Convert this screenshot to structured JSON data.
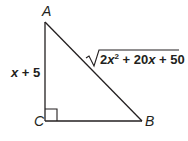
{
  "diagram": {
    "type": "right-triangle",
    "colors": {
      "stroke": "#231f20",
      "text": "#231f20",
      "background": "#ffffff"
    },
    "vertices": {
      "A": {
        "label": "A"
      },
      "B": {
        "label": "B"
      },
      "C": {
        "label": "C"
      }
    },
    "right_angle_at": "C",
    "sides": {
      "AC": {
        "label": "x + 5",
        "var": "x",
        "rest": " + 5"
      },
      "AB": {
        "label": "√(2x² + 20x + 50)",
        "radical_symbol": "√",
        "coef": "2",
        "var1": "x",
        "exp": "2",
        "mid": " + 20",
        "var2": "x",
        "tail": " + 50"
      }
    }
  }
}
